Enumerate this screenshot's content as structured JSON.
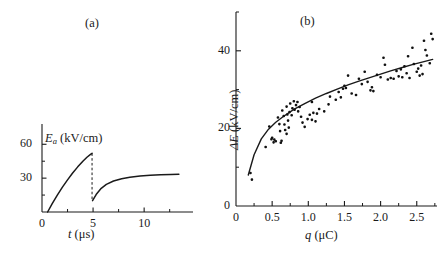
{
  "figure": {
    "panel_a_label": "(a)",
    "panel_b_label": "(b)"
  },
  "panel_a": {
    "y_title_main": "E",
    "y_title_sub": "a",
    "y_title_unit": " (kV/cm)",
    "x_title_sym": "t",
    "x_title_unit": " (μs)",
    "y_ticks": [
      "30",
      "60"
    ],
    "x_ticks": [
      "0",
      "5",
      "10"
    ]
  },
  "panel_b": {
    "y_title_sym": "ΔE",
    "y_title_unit": " (kV/cm)",
    "x_title_sym": "q",
    "x_title_unit": " (μC)",
    "y_ticks": [
      "0",
      "20",
      "40"
    ],
    "x_ticks": [
      "0",
      "0.5",
      "1.0",
      "1.5",
      "2.0",
      "2.5"
    ]
  },
  "chart_data": [
    {
      "type": "line",
      "panel": "(a)",
      "title": "",
      "xlabel": "t (μs)",
      "ylabel": "E_a (kV/cm)",
      "xlim": [
        0,
        14
      ],
      "ylim": [
        0,
        70
      ],
      "xticks": [
        0,
        5,
        10
      ],
      "yticks": [
        30,
        60
      ],
      "xminorticks": [
        2.5,
        7.5,
        12.5
      ],
      "yminorticks": [
        15,
        45
      ],
      "grid": false,
      "legend": null,
      "series": [
        {
          "name": "first charging ramp",
          "style": "solid",
          "x": [
            0.55,
            1.0,
            1.5,
            2.0,
            2.5,
            3.0,
            3.5,
            4.0,
            4.4,
            4.75,
            4.9
          ],
          "y": [
            0.0,
            7.5,
            15.0,
            22.0,
            28.5,
            34.5,
            40.0,
            45.0,
            48.5,
            51.0,
            52.0
          ]
        },
        {
          "name": "breakdown drop",
          "style": "dashed",
          "x": [
            4.9,
            4.9
          ],
          "y": [
            52.0,
            10.0
          ]
        },
        {
          "name": "second charging curve",
          "style": "solid",
          "x": [
            4.95,
            5.3,
            5.8,
            6.3,
            7.0,
            7.8,
            8.6,
            9.6,
            10.6,
            11.6,
            12.6,
            13.4
          ],
          "y": [
            10.0,
            15.5,
            21.0,
            24.5,
            27.5,
            29.5,
            30.8,
            31.8,
            32.5,
            33.0,
            33.3,
            33.5
          ]
        }
      ]
    },
    {
      "type": "scatter",
      "panel": "(b)",
      "title": "",
      "xlabel": "q (μC)",
      "ylabel": "ΔE (kV/cm)",
      "xlim": [
        0,
        2.78
      ],
      "ylim": [
        0,
        50
      ],
      "xticks": [
        0,
        0.5,
        1.0,
        1.5,
        2.0,
        2.5
      ],
      "yticks": [
        0,
        20,
        40
      ],
      "xminorticks": [
        0.25,
        0.75,
        1.25,
        1.75,
        2.25,
        2.75
      ],
      "yminorticks": [
        10,
        30,
        50
      ],
      "grid": false,
      "legend": null,
      "fit_curve": {
        "name": "fitted trend",
        "x": [
          0.17,
          0.25,
          0.35,
          0.45,
          0.55,
          0.65,
          0.8,
          0.95,
          1.1,
          1.25,
          1.4,
          1.55,
          1.7,
          1.85,
          2.0,
          2.15,
          2.3,
          2.45,
          2.6,
          2.72
        ],
        "y": [
          8.0,
          13.2,
          17.3,
          19.8,
          21.6,
          23.0,
          24.9,
          26.4,
          27.8,
          29.0,
          30.1,
          31.2,
          32.2,
          33.1,
          34.0,
          34.9,
          35.7,
          36.5,
          37.2,
          37.8
        ]
      },
      "points": [
        {
          "x": 0.2,
          "y": 8.5
        },
        {
          "x": 0.22,
          "y": 6.8
        },
        {
          "x": 0.46,
          "y": 20.5
        },
        {
          "x": 0.49,
          "y": 17.2
        },
        {
          "x": 0.5,
          "y": 17.6
        },
        {
          "x": 0.52,
          "y": 16.4
        },
        {
          "x": 0.53,
          "y": 17.1
        },
        {
          "x": 0.55,
          "y": 16.7
        },
        {
          "x": 0.41,
          "y": 15.2
        },
        {
          "x": 0.58,
          "y": 22.8
        },
        {
          "x": 0.6,
          "y": 21.1
        },
        {
          "x": 0.61,
          "y": 19.3
        },
        {
          "x": 0.62,
          "y": 16.3
        },
        {
          "x": 0.63,
          "y": 16.8
        },
        {
          "x": 0.64,
          "y": 24.6
        },
        {
          "x": 0.66,
          "y": 23.2
        },
        {
          "x": 0.67,
          "y": 21.0
        },
        {
          "x": 0.68,
          "y": 19.6
        },
        {
          "x": 0.7,
          "y": 25.6
        },
        {
          "x": 0.71,
          "y": 23.6
        },
        {
          "x": 0.72,
          "y": 22.0
        },
        {
          "x": 0.74,
          "y": 24.2
        },
        {
          "x": 0.75,
          "y": 26.4
        },
        {
          "x": 0.77,
          "y": 23.4
        },
        {
          "x": 0.78,
          "y": 25.2
        },
        {
          "x": 0.8,
          "y": 27.0
        },
        {
          "x": 0.81,
          "y": 24.8
        },
        {
          "x": 0.83,
          "y": 26.0
        },
        {
          "x": 0.85,
          "y": 26.8
        },
        {
          "x": 0.86,
          "y": 24.4
        },
        {
          "x": 0.88,
          "y": 25.5
        },
        {
          "x": 0.9,
          "y": 23.0
        },
        {
          "x": 0.92,
          "y": 21.5
        },
        {
          "x": 0.7,
          "y": 18.6
        },
        {
          "x": 0.73,
          "y": 20.2
        },
        {
          "x": 0.95,
          "y": 20.4
        },
        {
          "x": 0.99,
          "y": 22.4
        },
        {
          "x": 1.02,
          "y": 23.5
        },
        {
          "x": 1.05,
          "y": 22.2
        },
        {
          "x": 1.07,
          "y": 24.0
        },
        {
          "x": 1.1,
          "y": 21.8
        },
        {
          "x": 1.12,
          "y": 23.8
        },
        {
          "x": 1.05,
          "y": 26.8
        },
        {
          "x": 1.15,
          "y": 25.0
        },
        {
          "x": 1.22,
          "y": 24.4
        },
        {
          "x": 1.28,
          "y": 26.2
        },
        {
          "x": 1.3,
          "y": 28.2
        },
        {
          "x": 1.38,
          "y": 27.4
        },
        {
          "x": 1.42,
          "y": 29.4
        },
        {
          "x": 1.45,
          "y": 28.0
        },
        {
          "x": 1.48,
          "y": 30.2
        },
        {
          "x": 1.5,
          "y": 31.0
        },
        {
          "x": 1.52,
          "y": 30.4
        },
        {
          "x": 1.55,
          "y": 33.6
        },
        {
          "x": 1.6,
          "y": 29.0
        },
        {
          "x": 1.66,
          "y": 28.6
        },
        {
          "x": 1.7,
          "y": 32.8
        },
        {
          "x": 1.74,
          "y": 31.4
        },
        {
          "x": 1.78,
          "y": 34.6
        },
        {
          "x": 1.82,
          "y": 32.0
        },
        {
          "x": 1.86,
          "y": 29.8
        },
        {
          "x": 1.88,
          "y": 30.6
        },
        {
          "x": 1.9,
          "y": 29.6
        },
        {
          "x": 1.95,
          "y": 33.8
        },
        {
          "x": 2.0,
          "y": 33.2
        },
        {
          "x": 2.04,
          "y": 38.2
        },
        {
          "x": 2.06,
          "y": 36.4
        },
        {
          "x": 2.1,
          "y": 32.6
        },
        {
          "x": 2.14,
          "y": 33.0
        },
        {
          "x": 2.18,
          "y": 32.8
        },
        {
          "x": 2.22,
          "y": 34.8
        },
        {
          "x": 2.25,
          "y": 33.4
        },
        {
          "x": 2.28,
          "y": 35.2
        },
        {
          "x": 2.3,
          "y": 33.2
        },
        {
          "x": 2.33,
          "y": 36.0
        },
        {
          "x": 2.36,
          "y": 34.2
        },
        {
          "x": 2.4,
          "y": 33.0
        },
        {
          "x": 2.46,
          "y": 36.6
        },
        {
          "x": 2.5,
          "y": 34.6
        },
        {
          "x": 2.52,
          "y": 35.4
        },
        {
          "x": 2.54,
          "y": 33.6
        },
        {
          "x": 2.56,
          "y": 36.2
        },
        {
          "x": 2.58,
          "y": 34.0
        },
        {
          "x": 2.6,
          "y": 42.6
        },
        {
          "x": 2.62,
          "y": 40.2
        },
        {
          "x": 2.64,
          "y": 38.8
        },
        {
          "x": 2.68,
          "y": 36.8
        },
        {
          "x": 2.7,
          "y": 44.4
        },
        {
          "x": 2.72,
          "y": 43.0
        },
        {
          "x": 2.44,
          "y": 40.8
        },
        {
          "x": 2.38,
          "y": 38.6
        }
      ]
    }
  ]
}
